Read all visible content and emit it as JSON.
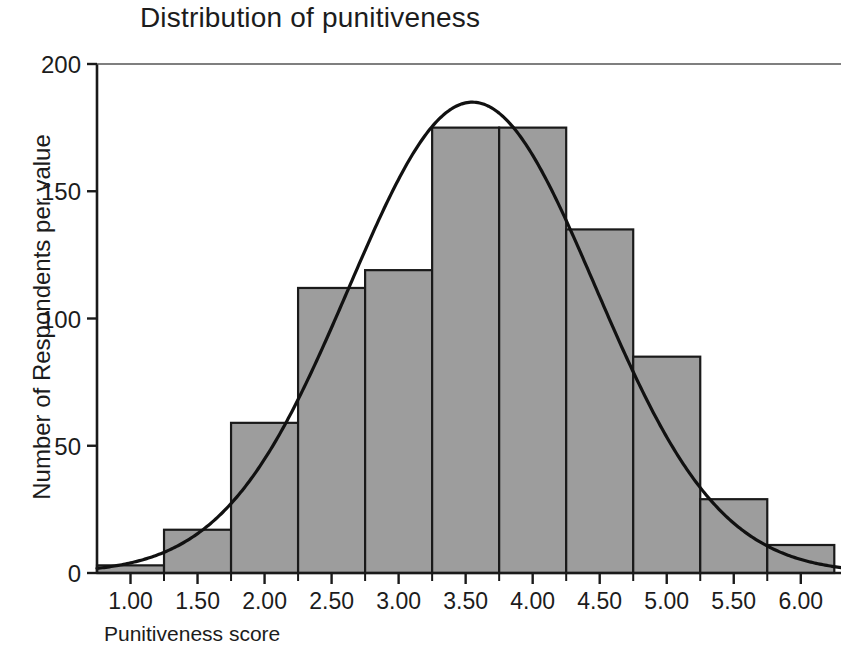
{
  "chart_data": {
    "type": "bar",
    "title": "Distribution of punitiveness",
    "xlabel": "Punitiveness score",
    "ylabel": "Number of Respondents per value",
    "categories": [
      "1.00",
      "1.50",
      "2.00",
      "2.50",
      "3.00",
      "3.50",
      "4.00",
      "4.50",
      "5.00",
      "5.50",
      "6.00"
    ],
    "x": [
      1.0,
      1.5,
      2.0,
      2.5,
      3.0,
      3.5,
      4.0,
      4.5,
      5.0,
      5.5,
      6.0
    ],
    "values": [
      3,
      17,
      59,
      112,
      119,
      175,
      175,
      135,
      85,
      29,
      11
    ],
    "bin_width": 0.5,
    "xlim": [
      0.75,
      6.3
    ],
    "ylim": [
      0,
      200
    ],
    "xticks": [
      1.0,
      1.5,
      2.0,
      2.5,
      3.0,
      3.5,
      4.0,
      4.5,
      5.0,
      5.5,
      6.0
    ],
    "xtick_labels": [
      "1.00",
      "1.50",
      "2.00",
      "2.50",
      "3.00",
      "3.50",
      "4.00",
      "4.50",
      "5.00",
      "5.50",
      "6.00"
    ],
    "yticks": [
      0,
      50,
      100,
      150,
      200
    ],
    "ytick_labels": [
      "0",
      "50",
      "100",
      "150",
      "200"
    ],
    "grid": false,
    "legend": false,
    "bar_fill_color": "#9d9d9d",
    "bar_edge_color": "#1a1a1a",
    "curve_color": "#111111",
    "overlay": {
      "name": "normal curve",
      "type": "line",
      "mean": 3.55,
      "std_dev": 0.92,
      "peak_value": 185,
      "description": "Normal distribution curve overlaid on histogram"
    }
  }
}
